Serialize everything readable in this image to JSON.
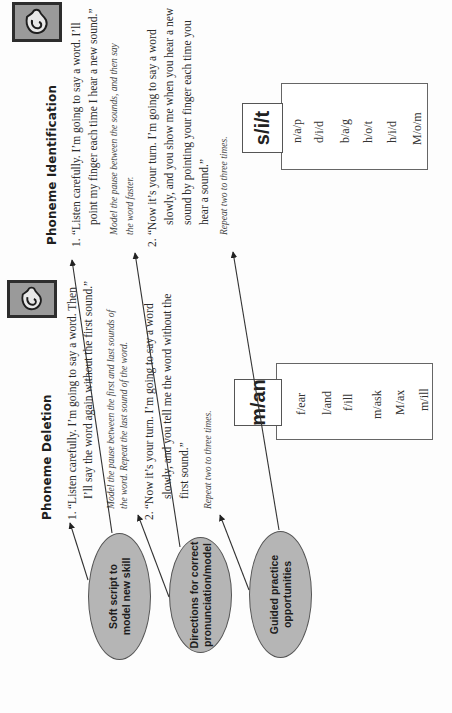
{
  "orientation": "rotated-90-ccw",
  "identification": {
    "icon": "ear-icon",
    "title": "Phoneme Identification",
    "steps": [
      {
        "num": "1.",
        "lines": [
          "“Listen carefully. I’m going to say a word. I’ll",
          "point my finger each time I hear a new sound.”"
        ]
      },
      {
        "num": "2.",
        "lines": [
          "“Now it’s your turn. I’m going to say a word",
          "slowly, and you show me when you hear a new",
          "sound by pointing your finger each time you",
          "hear a sound.”"
        ]
      }
    ],
    "note_lines": [
      "Model the pause between the sounds, and then say",
      "the word faster."
    ],
    "repeat": "Repeat two to three times.",
    "example_label": "s/i/t",
    "practice_words": [
      "n/a/p",
      "d/i/d",
      "b/a/g",
      "h/o/t",
      "h/i/d",
      "M/o/m"
    ]
  },
  "deletion": {
    "icon": "ear-icon",
    "title": "Phoneme Deletion",
    "steps": [
      {
        "num": "1.",
        "lines": [
          "“Listen carefully. I’m going to say a word. Then",
          "I’ll say the word again without the first sound.”"
        ]
      },
      {
        "num": "2.",
        "lines": [
          "“Now it’s your turn. I’m going to say a word",
          "slowly, and you tell me the word without the",
          "first sound.”"
        ]
      }
    ],
    "note_lines": [
      "Model the pause between the first and last sounds of",
      "the word. Repeat the last sound of the word."
    ],
    "repeat": "Repeat two to three times.",
    "example_label": "m/an",
    "practice_words": [
      "f/ear",
      "l/and",
      "f/ill",
      "m/ask",
      "M/ax",
      "m/ill"
    ]
  },
  "callouts": [
    {
      "label_lines": [
        "Soft script to",
        "model new skill"
      ]
    },
    {
      "label_lines": [
        "Directions for correct",
        "pronunciation/model"
      ]
    },
    {
      "label_lines": [
        "Guided practice",
        "opportunities"
      ]
    }
  ],
  "colors": {
    "callout_fill": "#b5b5b5",
    "icon_fill": "#9a9a9a",
    "text": "#2a2a2a"
  }
}
